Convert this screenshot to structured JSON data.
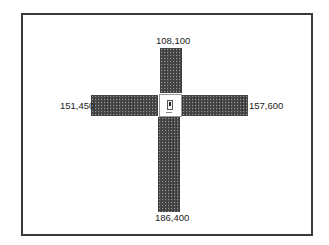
{
  "diagram": {
    "type": "intersection-volume-cross",
    "colors": {
      "frame": "#3a3a3a",
      "bar_fill": "#4a4a4a",
      "bar_dots": "#9a9a9a",
      "center_border": "#9a9a9a",
      "label_text": "#222222",
      "background": "#ffffff"
    },
    "approaches": {
      "north": {
        "label": "108,100",
        "value": 108100
      },
      "west": {
        "label": "151,450",
        "value": 151450
      },
      "east": {
        "label": "157,600",
        "value": 157600
      },
      "south": {
        "label": "186,400",
        "value": 186400
      }
    },
    "center": {
      "icon": "signal-marker-icon"
    }
  }
}
